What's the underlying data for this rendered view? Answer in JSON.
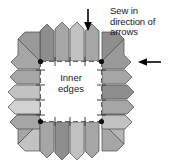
{
  "figure": {
    "type": "sewing-patchwork-diagram",
    "width": 169,
    "height": 167,
    "background_color": "#ffffff"
  },
  "annotations": {
    "callout": {
      "line1": "Sew in",
      "line2": "direction",
      "line3": "of arrows"
    },
    "center_label": {
      "line1": "Inner",
      "line2": "edges"
    }
  },
  "arrows": [
    {
      "name": "top-arrow",
      "direction": "down",
      "color": "#000000",
      "tail_x": 88,
      "tail_y": 10,
      "head_x": 88,
      "head_y": 30
    },
    {
      "name": "right-arrow",
      "direction": "left",
      "color": "#000000",
      "tail_x": 159,
      "tail_y": 62,
      "head_x": 138,
      "head_y": 62
    }
  ],
  "inner_square": {
    "name": "inner-edges-area",
    "x": 40,
    "y": 61,
    "width": 62,
    "height": 61,
    "fill": "#ffffff",
    "stitch_line_color": "#3a3a3a",
    "corner_dot_color": "#111111"
  },
  "colors": {
    "patch_dark": "#8e8e8e",
    "patch_mid": "#a6a6a6",
    "patch_light": "#c2c2c2",
    "patch_lightest": "#d2d2d2",
    "outline": "#4a4a4a",
    "text": "#1a1a1a",
    "arrow": "#000000"
  },
  "patches": {
    "count": 16,
    "shape": "pentagon",
    "top_row": [
      {
        "name": "patch-top-1",
        "fill": "#8e8e8e"
      },
      {
        "name": "patch-top-2",
        "fill": "#a6a6a6"
      },
      {
        "name": "patch-top-3",
        "fill": "#c2c2c2"
      },
      {
        "name": "patch-top-4",
        "fill": "#a6a6a6"
      }
    ],
    "bottom_row": [
      {
        "name": "patch-bottom-1",
        "fill": "#a6a6a6"
      },
      {
        "name": "patch-bottom-2",
        "fill": "#8e8e8e"
      },
      {
        "name": "patch-bottom-3",
        "fill": "#c2c2c2"
      },
      {
        "name": "patch-bottom-4",
        "fill": "#a6a6a6"
      }
    ],
    "left_col": [
      {
        "name": "patch-left-1",
        "fill": "#a6a6a6"
      },
      {
        "name": "patch-left-2",
        "fill": "#c2c2c2"
      },
      {
        "name": "patch-left-3",
        "fill": "#d2d2d2"
      },
      {
        "name": "patch-left-4",
        "fill": "#a6a6a6"
      }
    ],
    "right_col": [
      {
        "name": "patch-right-1",
        "fill": "#a6a6a6"
      },
      {
        "name": "patch-right-2",
        "fill": "#8e8e8e"
      },
      {
        "name": "patch-right-3",
        "fill": "#a6a6a6"
      },
      {
        "name": "patch-right-4",
        "fill": "#c2c2c2"
      }
    ],
    "corners": [
      {
        "name": "patch-corner-top-left",
        "fill": "#9a9a9a"
      },
      {
        "name": "patch-corner-top-right",
        "fill": "#8e8e8e"
      },
      {
        "name": "patch-corner-bottom-left",
        "fill": "#c2c2c2"
      },
      {
        "name": "patch-corner-bottom-right",
        "fill": "#a6a6a6"
      }
    ]
  }
}
